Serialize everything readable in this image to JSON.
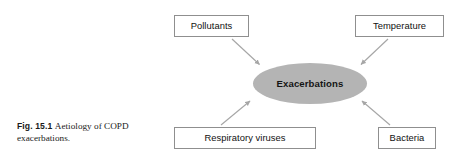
{
  "figure": {
    "caption_label": "Fig. 15.1",
    "caption_text": "Aetiology of COPD exacerbations.",
    "center_node": {
      "label": "Exacerbations",
      "fill_color": "#b4b4b4",
      "text_color": "#141414"
    },
    "nodes": [
      {
        "id": "pollutants",
        "label": "Pollutants",
        "position": "top-left"
      },
      {
        "id": "temperature",
        "label": "Temperature",
        "position": "top-right"
      },
      {
        "id": "respiratory",
        "label": "Respiratory viruses",
        "position": "bottom-left"
      },
      {
        "id": "bacteria",
        "label": "Bacteria",
        "position": "bottom-right"
      }
    ],
    "arrows": [
      {
        "from": "pollutants",
        "to": "center",
        "direction": "down-right"
      },
      {
        "from": "temperature",
        "to": "center",
        "direction": "down-left"
      },
      {
        "from": "respiratory",
        "to": "center",
        "direction": "up-right"
      },
      {
        "from": "bacteria",
        "to": "center",
        "direction": "up-left"
      }
    ],
    "colors": {
      "box_border": "#8f8f8f",
      "box_fill": "#ffffff",
      "arrow": "#a6a6a6",
      "background": "#ffffff",
      "text": "#111111"
    }
  }
}
